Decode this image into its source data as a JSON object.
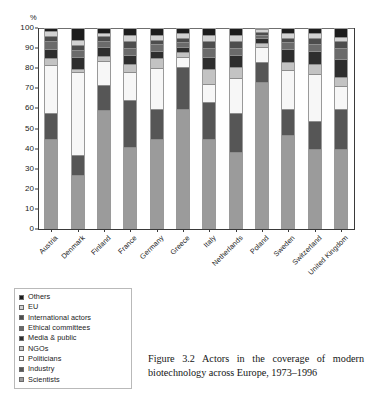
{
  "figure": {
    "caption": "Figure 3.2 Actors in the coverage of modern biotechnology across Europe, 1973–1996",
    "y_axis_unit": "%"
  },
  "legend": {
    "items": [
      {
        "label": "Others",
        "color": "#1c1c1c"
      },
      {
        "label": "EU",
        "color": "#d2d2d2"
      },
      {
        "label": "International actors",
        "color": "#4d4d4d"
      },
      {
        "label": "Ethical committees",
        "color": "#6b6b6b"
      },
      {
        "label": "Media & public",
        "color": "#2e2e2e"
      },
      {
        "label": "NGOs",
        "color": "#c3c3c3"
      },
      {
        "label": "Politicians",
        "color": "#f7f7f7"
      },
      {
        "label": "Industry",
        "color": "#565656"
      },
      {
        "label": "Scientists",
        "color": "#9b9b9b"
      }
    ]
  },
  "chart_data": {
    "type": "bar",
    "subtype": "stacked-vertical-100",
    "title": "Actors in the coverage of modern biotechnology across Europe, 1973–1996",
    "xlabel": "",
    "ylabel": "%",
    "ylim": [
      0,
      100
    ],
    "yticks": [
      0,
      10,
      20,
      30,
      40,
      50,
      60,
      70,
      80,
      90,
      100
    ],
    "grid": false,
    "legend_position": "below-left",
    "categories": [
      "Austria",
      "Denmark",
      "Finland",
      "France",
      "Germany",
      "Greece",
      "Italy",
      "Netherlands",
      "Poland",
      "Sweden",
      "Switzerland",
      "United Kingdom"
    ],
    "series": [
      {
        "name": "Scientists",
        "color": "#9b9b9b",
        "values": [
          46,
          27,
          61,
          42,
          46,
          62,
          46,
          39,
          76,
          48,
          41,
          41
        ]
      },
      {
        "name": "Industry",
        "color": "#565656",
        "values": [
          13,
          10,
          13,
          24,
          15,
          21,
          19,
          20,
          10,
          13,
          14,
          20
        ]
      },
      {
        "name": "Politicians",
        "color": "#f7f7f7",
        "values": [
          25,
          43,
          12,
          14,
          21,
          5,
          9,
          18,
          7,
          20,
          24,
          12
        ]
      },
      {
        "name": "NGOs",
        "color": "#c3c3c3",
        "values": [
          3,
          1,
          2,
          4,
          5,
          2,
          7,
          5,
          2,
          4,
          5,
          4
        ]
      },
      {
        "name": "Media & public",
        "color": "#2e2e2e",
        "values": [
          4,
          6,
          4,
          4,
          3,
          2,
          6,
          6,
          2,
          6,
          6,
          9
        ]
      },
      {
        "name": "Ethical committees",
        "color": "#6b6b6b",
        "values": [
          4,
          3,
          3,
          3,
          3,
          2,
          4,
          3,
          1,
          3,
          3,
          5
        ]
      },
      {
        "name": "International actors",
        "color": "#4d4d4d",
        "values": [
          2,
          2,
          2,
          3,
          2,
          2,
          3,
          3,
          1,
          2,
          3,
          3
        ]
      },
      {
        "name": "EU",
        "color": "#d2d2d2",
        "values": [
          2,
          2,
          1,
          3,
          2,
          2,
          3,
          3,
          1,
          2,
          2,
          2
        ]
      },
      {
        "name": "Others",
        "color": "#1c1c1c",
        "values": [
          1,
          6,
          2,
          3,
          3,
          2,
          3,
          3,
          0,
          2,
          2,
          4
        ]
      }
    ]
  }
}
